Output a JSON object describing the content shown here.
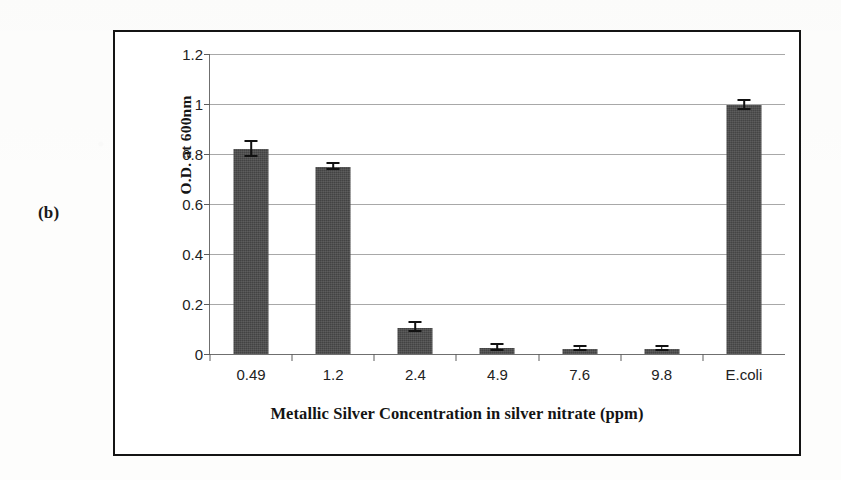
{
  "figure": {
    "panel_letter": "(b)"
  },
  "chart_data": {
    "type": "bar",
    "title": "",
    "xlabel": "Metallic Silver Concentration in silver nitrate (ppm)",
    "ylabel": "O.D. at 600nm",
    "categories": [
      "0.49",
      "1.2",
      "2.4",
      "4.9",
      "7.6",
      "9.8",
      "E.coli"
    ],
    "values": [
      0.82,
      0.75,
      0.105,
      0.025,
      0.022,
      0.02,
      0.995
    ],
    "errors": [
      0.03,
      0.012,
      0.018,
      0.012,
      0.008,
      0.007,
      0.018
    ],
    "ylim": [
      0,
      1.2
    ],
    "yticks": [
      "0",
      "0.2",
      "0.4",
      "0.6",
      "0.8",
      "1",
      "1.2"
    ],
    "ytick_values": [
      0,
      0.2,
      0.4,
      0.6,
      0.8,
      1,
      1.2
    ],
    "grid": true,
    "legend": "none",
    "bar_color": "#4a4a4a",
    "error_color": "#111111",
    "grid_color": "#a8a8a8",
    "axis_color": "#6f6f6f",
    "frame_color": "#141414"
  }
}
